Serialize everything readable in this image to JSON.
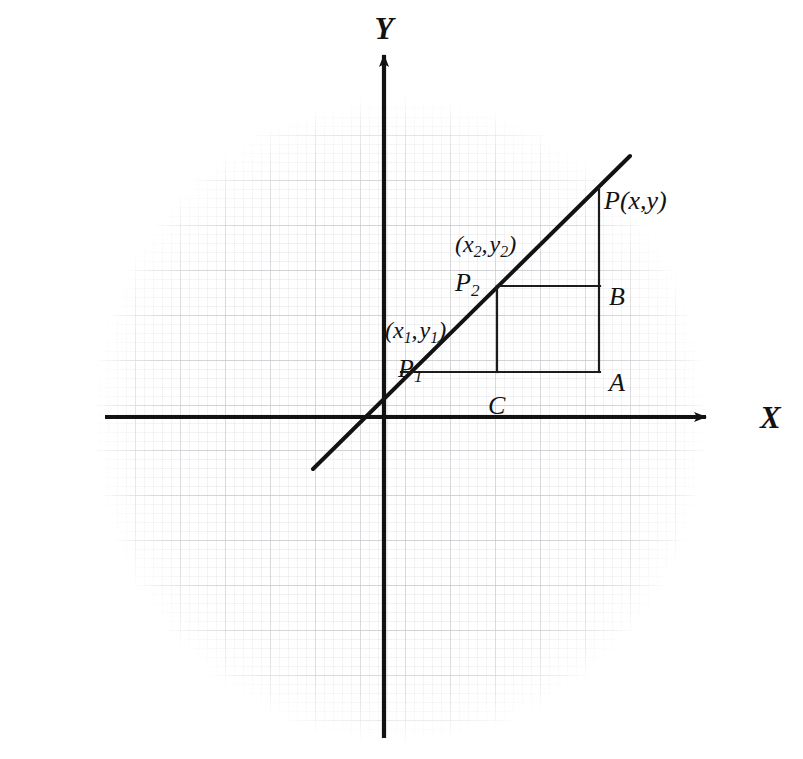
{
  "figure": {
    "type": "coordinate-geometry-diagram",
    "background": "#ffffff",
    "ink_color": "#121212",
    "grid_color": "#c9c9cd",
    "width": 803,
    "height": 759
  },
  "axes": {
    "x_label": "X",
    "y_label": "Y",
    "origin": {
      "x": 384,
      "y": 417
    },
    "x_axis": {
      "x1": 105,
      "y1": 417,
      "x2": 706,
      "y2": 417,
      "arrow": "right"
    },
    "y_axis": {
      "x1": 384,
      "y1": 738,
      "x2": 384,
      "y2": 55,
      "arrow": "up"
    },
    "x_label_pos": {
      "x": 760,
      "y": 417
    },
    "y_label_pos": {
      "x": 384,
      "y": 28
    }
  },
  "line": {
    "name": "slope-line",
    "x1": 313,
    "y1": 469,
    "x2": 630,
    "y2": 156
  },
  "points": [
    {
      "id": "P1",
      "label": "P",
      "subscript": "1",
      "coord_label": "(x₁, y₁)",
      "coord_x_var": "x",
      "coord_x_sub": "1",
      "coord_y_var": "y",
      "coord_y_sub": "1",
      "x": 401,
      "y": 372,
      "label_pos": {
        "x": 398,
        "y": 356
      },
      "coord_pos": {
        "x": 385,
        "y": 318
      }
    },
    {
      "id": "P2",
      "label": "P",
      "subscript": "2",
      "coord_label": "(x₂, y₂)",
      "coord_x_var": "x",
      "coord_x_sub": "2",
      "coord_y_var": "y",
      "coord_y_sub": "2",
      "x": 497,
      "y": 286,
      "label_pos": {
        "x": 455,
        "y": 270
      },
      "coord_pos": {
        "x": 455,
        "y": 232
      }
    },
    {
      "id": "P",
      "label": "P(x,y)",
      "x": 599,
      "y": 188,
      "label_pos": {
        "x": 604,
        "y": 188
      }
    }
  ],
  "vertices": [
    {
      "id": "A",
      "label": "A",
      "x": 599,
      "y": 372,
      "label_pos": {
        "x": 609,
        "y": 370
      }
    },
    {
      "id": "B",
      "label": "B",
      "x": 599,
      "y": 286,
      "label_pos": {
        "x": 609,
        "y": 284
      }
    },
    {
      "id": "C",
      "label": "C",
      "x": 497,
      "y": 372,
      "label_pos": {
        "x": 488,
        "y": 393
      }
    }
  ],
  "construction_segments": [
    {
      "name": "p1-to-a-horizontal",
      "x1": 401,
      "y1": 372,
      "x2": 600,
      "y2": 372
    },
    {
      "name": "a-to-p-vertical",
      "x1": 599,
      "y1": 372,
      "x2": 599,
      "y2": 188
    },
    {
      "name": "p2-to-b-horizontal",
      "x1": 497,
      "y1": 286,
      "x2": 600,
      "y2": 286
    },
    {
      "name": "p2-to-c-vertical",
      "x1": 497,
      "y1": 286,
      "x2": 497,
      "y2": 372
    }
  ],
  "grid": {
    "minor_spacing": 9,
    "major_spacing": 45,
    "shape": "rounded-blob",
    "center": {
      "x": 400,
      "y": 420
    },
    "radius_x": 300,
    "radius_y": 318
  }
}
